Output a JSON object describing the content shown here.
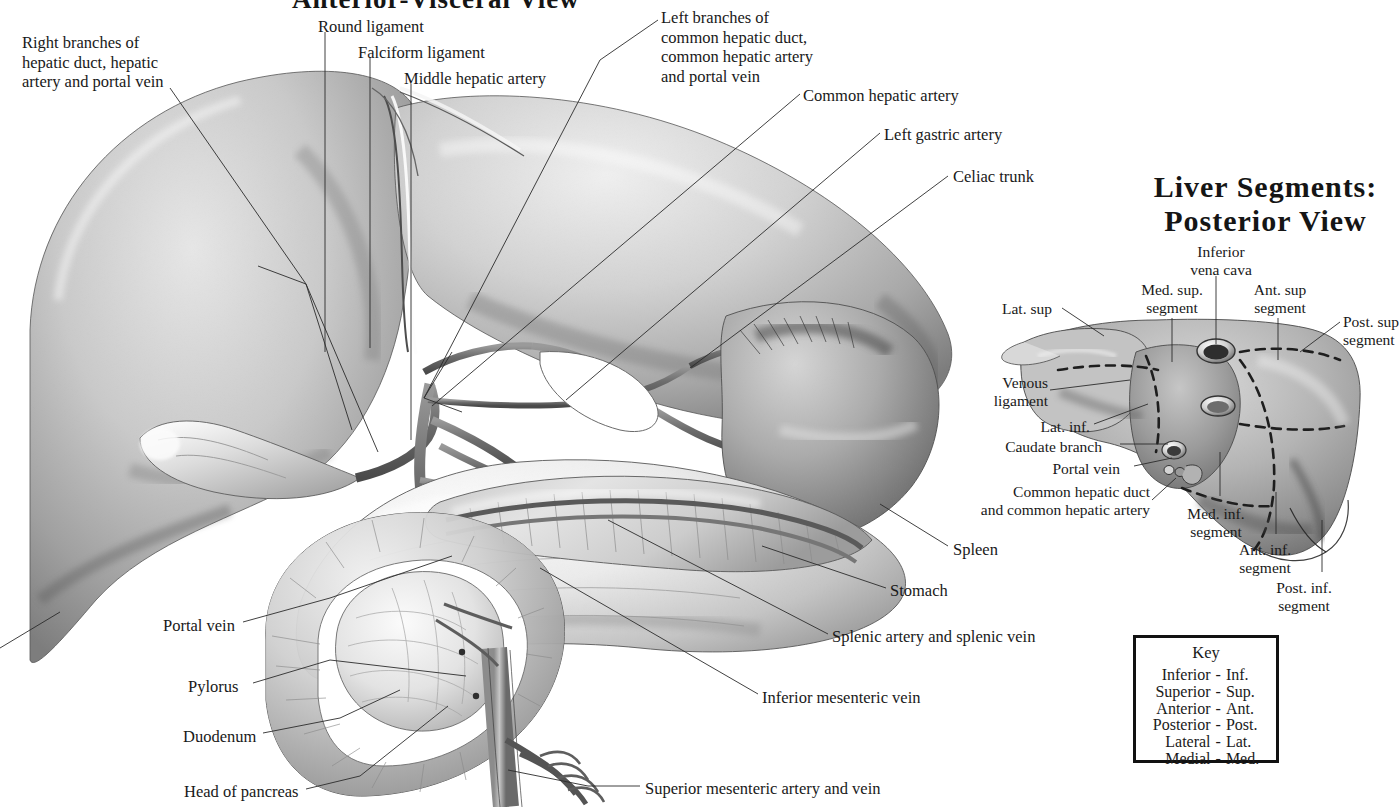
{
  "plate": {
    "main_title": "Anterior-Visceral View",
    "posterior_title_line1": "Liver Segments:",
    "posterior_title_line2": "Posterior View"
  },
  "main_view": {
    "labels": [
      {
        "id": "right-branches",
        "text": "Right branches of\nhepatic duct, hepatic\nartery and portal vein",
        "x": 22,
        "y": 33,
        "align": "left"
      },
      {
        "id": "round-ligament",
        "text": "Round ligament",
        "x": 318,
        "y": 17,
        "align": "left"
      },
      {
        "id": "falciform-ligament",
        "text": "Falciform ligament",
        "x": 358,
        "y": 43,
        "align": "left"
      },
      {
        "id": "middle-hepatic-artery",
        "text": "Middle hepatic artery",
        "x": 404,
        "y": 69,
        "align": "left"
      },
      {
        "id": "left-branches",
        "text": "Left branches of\ncommon hepatic duct,\ncommon hepatic artery\nand portal vein",
        "x": 661,
        "y": 8,
        "align": "left"
      },
      {
        "id": "common-hepatic-artery",
        "text": "Common hepatic artery",
        "x": 803,
        "y": 86,
        "align": "left"
      },
      {
        "id": "left-gastric-artery",
        "text": "Left gastric artery",
        "x": 884,
        "y": 125,
        "align": "left"
      },
      {
        "id": "celiac-trunk",
        "text": "Celiac trunk",
        "x": 953,
        "y": 167,
        "align": "left"
      },
      {
        "id": "spleen",
        "text": "Spleen",
        "x": 953,
        "y": 540,
        "align": "left"
      },
      {
        "id": "stomach",
        "text": "Stomach",
        "x": 890,
        "y": 581,
        "align": "left"
      },
      {
        "id": "splenic-artery-vein",
        "text": "Splenic artery and splenic vein",
        "x": 832,
        "y": 627,
        "align": "left"
      },
      {
        "id": "inferior-mesenteric-vein",
        "text": "Inferior mesenteric vein",
        "x": 762,
        "y": 688,
        "align": "left"
      },
      {
        "id": "superior-mesenteric",
        "text": "Superior mesenteric artery and vein",
        "x": 645,
        "y": 779,
        "align": "left"
      },
      {
        "id": "portal-vein-main",
        "text": "Portal vein",
        "x": 163,
        "y": 616,
        "align": "left"
      },
      {
        "id": "pylorus",
        "text": "Pylorus",
        "x": 188,
        "y": 677,
        "align": "left"
      },
      {
        "id": "duodenum",
        "text": "Duodenum",
        "x": 183,
        "y": 727,
        "align": "left"
      },
      {
        "id": "head-of-pancreas",
        "text": "Head of pancreas",
        "x": 184,
        "y": 782,
        "align": "left"
      }
    ]
  },
  "posterior_view": {
    "labels": [
      {
        "id": "inferior-vena-cava",
        "text": "Inferior\nvena cava",
        "x": 1184,
        "y": 243,
        "align": "left"
      },
      {
        "id": "med-sup-segment",
        "text": "Med. sup.\nsegment",
        "x": 1139,
        "y": 281,
        "align": "left"
      },
      {
        "id": "ant-sup-segment",
        "text": "Ant. sup\nsegment",
        "x": 1251,
        "y": 281,
        "align": "left"
      },
      {
        "id": "lat-sup",
        "text": "Lat. sup",
        "x": 1002,
        "y": 300,
        "align": "left"
      },
      {
        "id": "post-sup-segment",
        "text": "Post. sup\nsegment",
        "x": 1343,
        "y": 313,
        "align": "left"
      },
      {
        "id": "venous-ligament",
        "text": "Venous\nligament",
        "x": 986,
        "y": 374,
        "align": "left"
      },
      {
        "id": "lat-inf",
        "text": "Lat. inf.",
        "x": 1038,
        "y": 418,
        "align": "left"
      },
      {
        "id": "caudate-branch",
        "text": "Caudate branch",
        "x": 1004,
        "y": 438,
        "align": "left"
      },
      {
        "id": "portal-vein-post",
        "text": "Portal vein",
        "x": 1056,
        "y": 460,
        "align": "left"
      },
      {
        "id": "common-hepatic-duct",
        "text": "Common hepatic duct\nand common hepatic artery",
        "x": 982,
        "y": 483,
        "align": "left"
      },
      {
        "id": "med-inf-segment",
        "text": "Med. inf.\nsegment",
        "x": 1177,
        "y": 505,
        "align": "left"
      },
      {
        "id": "ant-inf-segment",
        "text": "Ant. inf.\nsegment",
        "x": 1229,
        "y": 541,
        "align": "left"
      },
      {
        "id": "post-inf-segment",
        "text": "Post. inf.\nsegment",
        "x": 1266,
        "y": 579,
        "align": "left"
      }
    ]
  },
  "key": {
    "title": "Key",
    "rows": [
      {
        "full": "Inferior",
        "sep": "-",
        "abbr": "Inf."
      },
      {
        "full": "Superior",
        "sep": "-",
        "abbr": "Sup."
      },
      {
        "full": "Anterior",
        "sep": "-",
        "abbr": "Ant."
      },
      {
        "full": "Posterior",
        "sep": "-",
        "abbr": "Post."
      },
      {
        "full": "Lateral",
        "sep": "-",
        "abbr": "Lat."
      },
      {
        "full": "Medial",
        "sep": "-",
        "abbr": "Med."
      }
    ]
  },
  "style": {
    "ink": "#191919",
    "leader": "#2b2b2b",
    "paper": "#ffffff",
    "graphite_light": "#e8e8e8",
    "graphite_mid": "#b9b9b9",
    "graphite_dark": "#6f6f6f",
    "graphite_darkest": "#3a3a3a"
  }
}
